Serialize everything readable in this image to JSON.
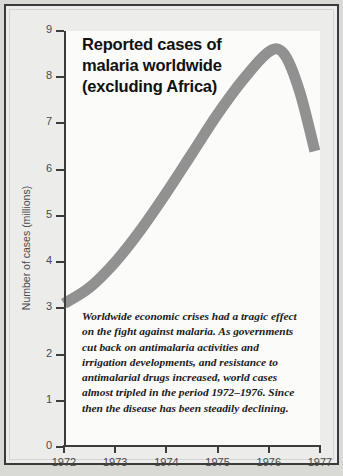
{
  "chart_data": {
    "type": "line",
    "title": "Reported cases of malaria worldwide (excluding Africa)",
    "title_lines": [
      "Reported cases of",
      "malaria worldwide",
      "(excluding Africa)"
    ],
    "xlabel": "",
    "ylabel": "Number of cases (millions)",
    "xlim": [
      1972,
      1977
    ],
    "ylim": [
      0,
      9
    ],
    "grid": false,
    "legend": false,
    "series_color": "#919191",
    "x_tick_labels": [
      "1972",
      "1973",
      "1974",
      "1975",
      "1976",
      "1977"
    ],
    "y_tick_labels": [
      "0",
      "1",
      "2",
      "3",
      "4",
      "5",
      "6",
      "7",
      "8",
      "9"
    ],
    "x": [
      1972,
      1972.5,
      1973,
      1973.5,
      1974,
      1974.5,
      1975,
      1975.5,
      1976,
      1976.3,
      1976.6,
      1976.9
    ],
    "values": [
      3.1,
      3.45,
      4.0,
      4.7,
      5.5,
      6.35,
      7.2,
      7.95,
      8.55,
      8.5,
      7.7,
      6.4
    ],
    "series": [
      {
        "name": "Reported malaria cases (excluding Africa)",
        "values": [
          3.1,
          3.45,
          4.0,
          4.7,
          5.5,
          6.35,
          7.2,
          7.95,
          8.55,
          8.5,
          7.7,
          6.4
        ]
      }
    ],
    "annotations": [
      "Worldwide economic crises had a tragic effect on the fight against malaria. As governments cut back on antimalaria activities and irrigation developments, and resistance to antimalarial drugs increased, world cases almost tripled in the period 1972-1976. Since then the disease has been steadily declining."
    ],
    "caption_lines": [
      "Worldwide economic crises had a tragic effect",
      "on the fight against malaria. As governments",
      "cut back on antimalaria activities and",
      "irrigation developments, and resistance to",
      "antimalarial drugs increased, world cases",
      "almost tripled in the period 1972–1976. Since",
      "then the disease has been steadily declining."
    ]
  },
  "colors": {
    "frame_border": "#3a3a3a",
    "page_background": "#d9d9d6",
    "panel_background": "#ececeb",
    "plot_background": "#fbfbfa",
    "axis": "#3c3c3c",
    "curve": "#919191",
    "title_text": "#111111",
    "tick_text": "#4a4a4a"
  }
}
